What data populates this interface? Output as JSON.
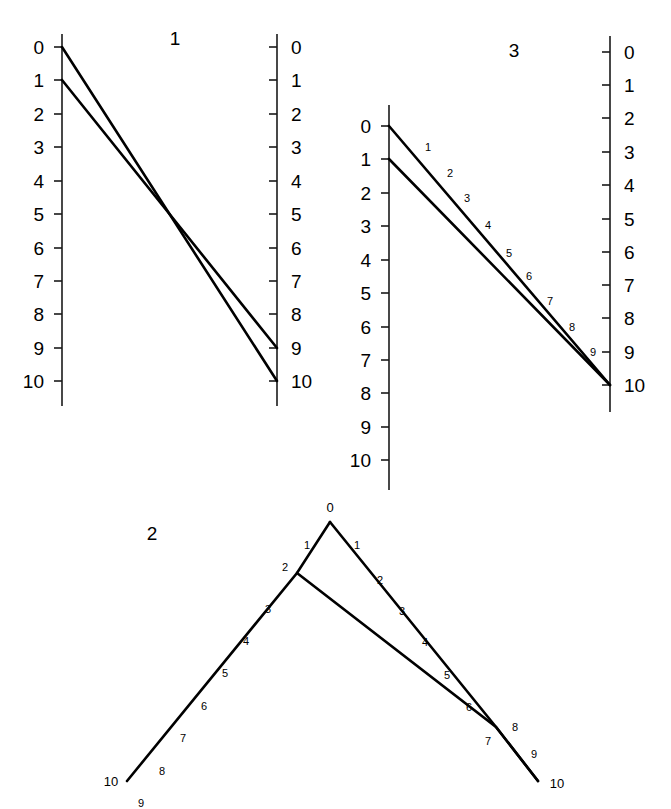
{
  "figure": {
    "background_color": "#ffffff",
    "ink_color": "#000000",
    "width": 671,
    "height": 809
  },
  "panels": [
    {
      "id": "panel-1",
      "title": "1",
      "title_pos": {
        "x": 175,
        "y": 45
      },
      "axes": [
        {
          "id": "panel1-left-axis",
          "name": "left-axis",
          "x": 62,
          "y_top": 34,
          "y_bottom": 406,
          "tick_side": "left",
          "label_side": "left",
          "ticks": [
            {
              "label": "0",
              "value": 0,
              "y": 47
            },
            {
              "label": "1",
              "value": 1,
              "y": 80
            },
            {
              "label": "2",
              "value": 2,
              "y": 114
            },
            {
              "label": "3",
              "value": 3,
              "y": 147
            },
            {
              "label": "4",
              "value": 4,
              "y": 181
            },
            {
              "label": "5",
              "value": 5,
              "y": 214
            },
            {
              "label": "6",
              "value": 6,
              "y": 248
            },
            {
              "label": "7",
              "value": 7,
              "y": 281
            },
            {
              "label": "8",
              "value": 8,
              "y": 314
            },
            {
              "label": "9",
              "value": 9,
              "y": 348
            },
            {
              "label": "10",
              "value": 10,
              "y": 381
            }
          ]
        },
        {
          "id": "panel1-right-axis",
          "name": "right-axis",
          "x": 277,
          "y_top": 34,
          "y_bottom": 406,
          "tick_side": "left",
          "label_side": "right",
          "ticks": [
            {
              "label": "0",
              "value": 0,
              "y": 47
            },
            {
              "label": "1",
              "value": 1,
              "y": 80
            },
            {
              "label": "2",
              "value": 2,
              "y": 114
            },
            {
              "label": "3",
              "value": 3,
              "y": 147
            },
            {
              "label": "4",
              "value": 4,
              "y": 181
            },
            {
              "label": "5",
              "value": 5,
              "y": 214
            },
            {
              "label": "6",
              "value": 6,
              "y": 248
            },
            {
              "label": "7",
              "value": 7,
              "y": 281
            },
            {
              "label": "8",
              "value": 8,
              "y": 314
            },
            {
              "label": "9",
              "value": 9,
              "y": 348
            },
            {
              "label": "10",
              "value": 10,
              "y": 381
            }
          ]
        }
      ],
      "index_lines": [
        {
          "id": "panel1-line-a",
          "from": "left 0",
          "to": "right 10",
          "points": "62,47 277,381"
        },
        {
          "id": "panel1-line-b",
          "from": "left 1",
          "to": "right 9",
          "points": "62,80 277,348"
        }
      ],
      "line_labels": []
    },
    {
      "id": "panel-3",
      "title": "3",
      "title_pos": {
        "x": 514,
        "y": 57
      },
      "axes": [
        {
          "id": "panel3-left-axis",
          "name": "left-axis",
          "x": 389,
          "y_top": 105,
          "y_bottom": 490,
          "tick_side": "left",
          "label_side": "left",
          "ticks": [
            {
              "label": "0",
              "value": 0,
              "y": 126
            },
            {
              "label": "1",
              "value": 1,
              "y": 159
            },
            {
              "label": "2",
              "value": 2,
              "y": 193
            },
            {
              "label": "3",
              "value": 3,
              "y": 226
            },
            {
              "label": "4",
              "value": 4,
              "y": 260
            },
            {
              "label": "5",
              "value": 5,
              "y": 293
            },
            {
              "label": "6",
              "value": 6,
              "y": 327
            },
            {
              "label": "7",
              "value": 7,
              "y": 360
            },
            {
              "label": "8",
              "value": 8,
              "y": 393
            },
            {
              "label": "9",
              "value": 9,
              "y": 427
            },
            {
              "label": "10",
              "value": 10,
              "y": 460
            }
          ]
        },
        {
          "id": "panel3-right-axis",
          "name": "right-axis",
          "x": 610,
          "y_top": 36,
          "y_bottom": 412,
          "tick_side": "left",
          "label_side": "right",
          "ticks": [
            {
              "label": "0",
              "value": 0,
              "y": 52
            },
            {
              "label": "1",
              "value": 1,
              "y": 85
            },
            {
              "label": "2",
              "value": 2,
              "y": 118
            },
            {
              "label": "3",
              "value": 3,
              "y": 152
            },
            {
              "label": "4",
              "value": 4,
              "y": 185
            },
            {
              "label": "5",
              "value": 5,
              "y": 219
            },
            {
              "label": "6",
              "value": 6,
              "y": 252
            },
            {
              "label": "7",
              "value": 7,
              "y": 285
            },
            {
              "label": "8",
              "value": 8,
              "y": 318
            },
            {
              "label": "9",
              "value": 9,
              "y": 352
            },
            {
              "label": "10",
              "value": 10,
              "y": 385
            }
          ]
        }
      ],
      "index_lines": [
        {
          "id": "panel3-line-a",
          "from": "left 0",
          "to": "right 10",
          "points": "389,126 610,385"
        },
        {
          "id": "panel3-line-b",
          "from": "left 1",
          "to": "right 10",
          "points": "389,159 610,385"
        }
      ],
      "line_labels": [
        {
          "text": "1",
          "x": 428,
          "y": 151
        },
        {
          "text": "2",
          "x": 450,
          "y": 177
        },
        {
          "text": "3",
          "x": 467,
          "y": 202
        },
        {
          "text": "4",
          "x": 488,
          "y": 229
        },
        {
          "text": "5",
          "x": 509,
          "y": 257
        },
        {
          "text": "6",
          "x": 529,
          "y": 280
        },
        {
          "text": "7",
          "x": 550,
          "y": 305
        },
        {
          "text": "8",
          "x": 572,
          "y": 331
        },
        {
          "text": "9",
          "x": 593,
          "y": 356
        }
      ]
    },
    {
      "id": "panel-2",
      "title": "2",
      "title_pos": {
        "x": 152,
        "y": 540
      },
      "axes": [],
      "index_lines": [
        {
          "id": "panel2-line-left",
          "from": "apex 0",
          "to": "bottom-left 10",
          "points": "330,522 297,573 127,781"
        },
        {
          "id": "panel2-line-right",
          "from": "apex 0",
          "to": "bottom-right 10",
          "points": "330,522 496,727 538,781"
        },
        {
          "id": "panel2-line-cross",
          "from": "node 2",
          "to": "bottom-right 10",
          "points": "297,573 496,727 538,781"
        }
      ],
      "line_labels": [
        {
          "text": "0",
          "x": 330,
          "y": 512,
          "size": "big"
        },
        {
          "text": "1",
          "x": 307,
          "y": 549
        },
        {
          "text": "1",
          "x": 357,
          "y": 549
        },
        {
          "text": "2",
          "x": 285,
          "y": 571
        },
        {
          "text": "2",
          "x": 380,
          "y": 584
        },
        {
          "text": "3",
          "x": 268,
          "y": 613
        },
        {
          "text": "3",
          "x": 402,
          "y": 615
        },
        {
          "text": "4",
          "x": 246,
          "y": 645
        },
        {
          "text": "4",
          "x": 425,
          "y": 646
        },
        {
          "text": "5",
          "x": 225,
          "y": 677
        },
        {
          "text": "5",
          "x": 447,
          "y": 679
        },
        {
          "text": "6",
          "x": 204,
          "y": 710
        },
        {
          "text": "6",
          "x": 469,
          "y": 711
        },
        {
          "text": "7",
          "x": 183,
          "y": 742
        },
        {
          "text": "7",
          "x": 488,
          "y": 745
        },
        {
          "text": "8",
          "x": 162,
          "y": 775
        },
        {
          "text": "8",
          "x": 515,
          "y": 731
        },
        {
          "text": "9",
          "x": 141,
          "y": 807
        },
        {
          "text": "9",
          "x": 534,
          "y": 758
        },
        {
          "text": "10",
          "x": 111,
          "y": 786,
          "size": "big"
        },
        {
          "text": "10",
          "x": 557,
          "y": 788,
          "size": "big"
        }
      ]
    }
  ]
}
